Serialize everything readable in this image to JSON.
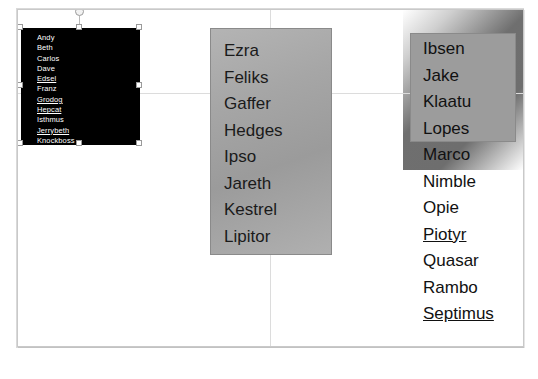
{
  "app": {
    "canvas_label": "slide-canvas"
  },
  "guides": {
    "vertical_label": "vertical-center-guide",
    "horizontal_label": "horizontal-center-guide"
  },
  "shapes": {
    "black_box": {
      "name": "black-text-box",
      "selected": true,
      "fill": "#000000",
      "text_color": "#ffffff",
      "items": [
        {
          "label": "Andy",
          "underline": false
        },
        {
          "label": "Beth",
          "underline": false
        },
        {
          "label": "Carlos",
          "underline": false
        },
        {
          "label": "Dave",
          "underline": false
        },
        {
          "label": "Edsel",
          "underline": true
        },
        {
          "label": "Franz",
          "underline": false
        },
        {
          "label": "Grodog",
          "underline": true
        },
        {
          "label": "Hepcat",
          "underline": true
        },
        {
          "label": "Isthmus",
          "underline": false
        },
        {
          "label": "Jerrybeth",
          "underline": true
        },
        {
          "label": "Knockboss",
          "underline": false
        }
      ]
    },
    "middle_box": {
      "name": "middle-gradient-box",
      "fill": "#a6a6a6",
      "text_color": "#1a1a1a",
      "items": [
        {
          "label": "Ezra",
          "underline": false
        },
        {
          "label": "Feliks",
          "underline": false
        },
        {
          "label": "Gaffer",
          "underline": false
        },
        {
          "label": "Hedges",
          "underline": false
        },
        {
          "label": "Ipso",
          "underline": false
        },
        {
          "label": "Jareth",
          "underline": false
        },
        {
          "label": "Kestrel",
          "underline": false
        },
        {
          "label": "Lipitor",
          "underline": false
        }
      ]
    },
    "right_box": {
      "name": "right-gray-box",
      "fill": "#9c9c9c"
    },
    "right_list": {
      "name": "right-text-list",
      "text_color": "#111111",
      "items": [
        {
          "label": "Ibsen",
          "underline": false
        },
        {
          "label": "Jake",
          "underline": false
        },
        {
          "label": "Klaatu",
          "underline": false
        },
        {
          "label": "Lopes",
          "underline": false
        },
        {
          "label": "Marco",
          "underline": false
        },
        {
          "label": "Nimble",
          "underline": false
        },
        {
          "label": "Opie",
          "underline": false
        },
        {
          "label": "Piotyr",
          "underline": true
        },
        {
          "label": "Quasar",
          "underline": false
        },
        {
          "label": "Rambo",
          "underline": false
        },
        {
          "label": "Septimus",
          "underline": true
        }
      ]
    }
  }
}
